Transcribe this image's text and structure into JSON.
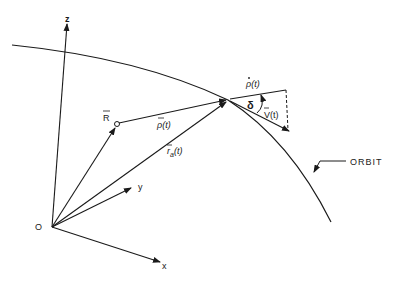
{
  "diagram": {
    "type": "vector-geometry",
    "labels": {
      "z_axis": "z",
      "y_axis": "y",
      "x_axis": "x",
      "origin": "O",
      "R_vector": "R",
      "rho_vector": "ρ(t)",
      "rho_dot": "ρ(t)",
      "r_a_vector": "r",
      "r_a_subscript": "a",
      "r_a_arg": "(t)",
      "v_vector": "V(t)",
      "delta": "δ",
      "orbit": "ORBIT"
    },
    "colors": {
      "ink": "#1a1a1a",
      "background": "#ffffff"
    }
  }
}
